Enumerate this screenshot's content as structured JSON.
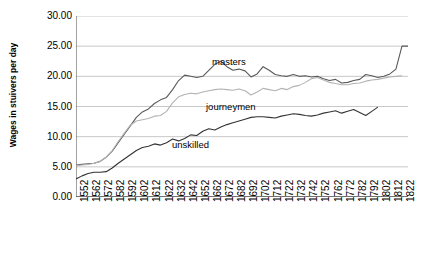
{
  "chart_data": {
    "type": "line",
    "title": "",
    "xlabel": "",
    "ylabel": "Wages in stuivers per day",
    "ylim": [
      0,
      30
    ],
    "yticks": [
      "0.00",
      "5.00",
      "10.00",
      "15.00",
      "20.00",
      "25.00",
      "30.00"
    ],
    "ytick_values": [
      0,
      5,
      10,
      15,
      20,
      25,
      30
    ],
    "xlim": [
      1552,
      1827
    ],
    "grid": true,
    "legend_position": "inline-annotations",
    "categories": [
      1552,
      1562,
      1572,
      1582,
      1592,
      1602,
      1612,
      1622,
      1632,
      1642,
      1652,
      1662,
      1672,
      1682,
      1692,
      1702,
      1712,
      1722,
      1732,
      1742,
      1752,
      1762,
      1772,
      1782,
      1792,
      1802,
      1812,
      1822
    ],
    "series": [
      {
        "name": "masters",
        "color": "#595959",
        "x": [
          1552,
          1557,
          1562,
          1567,
          1572,
          1577,
          1582,
          1587,
          1592,
          1597,
          1602,
          1607,
          1612,
          1617,
          1622,
          1627,
          1632,
          1637,
          1642,
          1647,
          1652,
          1657,
          1662,
          1667,
          1672,
          1677,
          1682,
          1687,
          1692,
          1697,
          1702,
          1707,
          1712,
          1717,
          1722,
          1727,
          1732,
          1737,
          1742,
          1747,
          1752,
          1757,
          1762,
          1767,
          1772,
          1777,
          1782,
          1787,
          1792,
          1797,
          1802,
          1807,
          1812,
          1817,
          1822,
          1827
        ],
        "values": [
          5.3,
          5.4,
          5.5,
          5.6,
          5.9,
          6.6,
          7.6,
          9.0,
          10.4,
          11.8,
          13.2,
          14.1,
          14.6,
          15.5,
          16.1,
          16.5,
          17.8,
          19.3,
          20.2,
          20.0,
          19.8,
          20.0,
          21.0,
          22.0,
          22.5,
          21.6,
          21.0,
          21.2,
          20.9,
          19.9,
          20.4,
          21.6,
          21.0,
          20.3,
          20.1,
          20.0,
          20.3,
          20.0,
          20.1,
          19.9,
          20.0,
          19.6,
          19.3,
          19.5,
          18.9,
          19.0,
          19.3,
          19.5,
          20.3,
          20.1,
          19.8,
          20.0,
          20.4,
          21.2,
          25.0,
          25.0
        ]
      },
      {
        "name": "journeymen",
        "color": "#b3b3b3",
        "x": [
          1552,
          1557,
          1562,
          1567,
          1572,
          1577,
          1582,
          1587,
          1592,
          1597,
          1602,
          1607,
          1612,
          1617,
          1622,
          1627,
          1632,
          1637,
          1642,
          1647,
          1652,
          1657,
          1662,
          1667,
          1672,
          1677,
          1682,
          1687,
          1692,
          1697,
          1702,
          1707,
          1712,
          1717,
          1722,
          1727,
          1732,
          1737,
          1742,
          1747,
          1752,
          1757,
          1762,
          1767,
          1772,
          1777,
          1782,
          1787,
          1792,
          1797,
          1802,
          1807,
          1812,
          1817,
          1822
        ],
        "values": [
          5.2,
          5.3,
          5.4,
          5.6,
          5.9,
          6.6,
          7.7,
          9.2,
          10.6,
          11.9,
          12.6,
          12.8,
          13.0,
          13.4,
          13.5,
          14.2,
          15.6,
          16.6,
          17.0,
          17.2,
          17.1,
          17.4,
          17.6,
          17.8,
          17.9,
          17.8,
          17.7,
          17.9,
          17.6,
          16.9,
          17.4,
          18.0,
          17.8,
          17.6,
          18.0,
          17.8,
          18.3,
          18.5,
          19.0,
          19.6,
          19.8,
          19.4,
          19.0,
          18.8,
          18.6,
          18.6,
          18.8,
          18.9,
          19.2,
          19.4,
          19.5,
          19.7,
          19.9,
          20.0,
          20.1
        ]
      },
      {
        "name": "unskilled",
        "color": "#333333",
        "x": [
          1552,
          1557,
          1562,
          1567,
          1572,
          1577,
          1582,
          1587,
          1592,
          1597,
          1602,
          1607,
          1612,
          1617,
          1622,
          1627,
          1632,
          1637,
          1642,
          1647,
          1652,
          1657,
          1662,
          1667,
          1672,
          1677,
          1682,
          1687,
          1692,
          1697,
          1702,
          1707,
          1712,
          1717,
          1722,
          1727,
          1732,
          1737,
          1742,
          1747,
          1752,
          1757,
          1762,
          1767,
          1772,
          1777,
          1782,
          1787,
          1792,
          1797,
          1802
        ],
        "values": [
          3.0,
          3.5,
          3.9,
          4.1,
          4.1,
          4.2,
          4.8,
          5.6,
          6.3,
          7.0,
          7.7,
          8.2,
          8.4,
          8.8,
          8.6,
          9.0,
          9.6,
          9.3,
          9.7,
          10.3,
          10.2,
          10.9,
          11.3,
          11.1,
          11.6,
          12.0,
          12.3,
          12.6,
          12.9,
          13.2,
          13.3,
          13.3,
          13.2,
          13.1,
          13.4,
          13.6,
          13.8,
          13.7,
          13.5,
          13.4,
          13.6,
          13.9,
          14.1,
          14.3,
          13.9,
          14.2,
          14.5,
          14.0,
          13.5,
          14.2,
          14.9
        ]
      }
    ],
    "annotations": [
      {
        "name": "masters",
        "text": "masters",
        "x_px": 212,
        "y_px": 56
      },
      {
        "name": "journeymen",
        "text": "journeymen",
        "x_px": 206,
        "y_px": 101
      },
      {
        "name": "unskilled",
        "text": "unskilled",
        "x_px": 172,
        "y_px": 139
      }
    ],
    "colors": {
      "masters": "#595959",
      "journeymen": "#b3b3b3",
      "unskilled": "#333333",
      "grid": "#c8c8c8",
      "axis": "#555555",
      "background": "#ffffff"
    }
  }
}
